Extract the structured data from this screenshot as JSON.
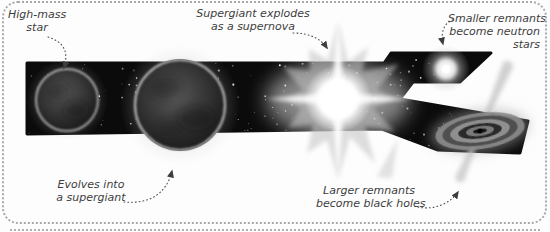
{
  "diagram": {
    "background_color": "#fdfdfd",
    "border_color": "#a8a8a8",
    "band_color": "#0b0b0b",
    "text_color": "#3d3d3d",
    "labels": {
      "high_mass_star": {
        "lines": [
          "High-mass",
          "star"
        ]
      },
      "supernova": {
        "lines": [
          "Supergiant explodes",
          "as a supernova"
        ]
      },
      "neutron_star": {
        "lines": [
          "Smaller remnants",
          "become neutron",
          "stars"
        ]
      },
      "supergiant": {
        "lines": [
          "Evolves into",
          "a supergiant"
        ]
      },
      "black_hole": {
        "lines": [
          "Larger remnants",
          "become black holes"
        ]
      }
    },
    "graphics": {
      "band": "starfield-ribbon",
      "object_1": "high-mass-star",
      "object_2": "supergiant-star",
      "object_3": "supernova-burst",
      "object_4": "neutron-star",
      "object_5": "black-hole-accretion-disk"
    }
  }
}
